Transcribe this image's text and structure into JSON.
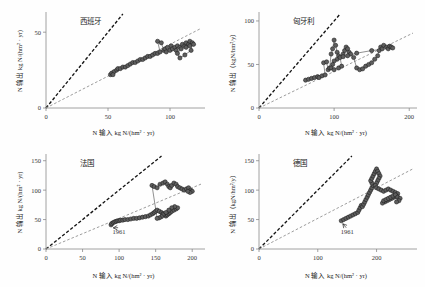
{
  "figure": {
    "background": "#fefefe",
    "panel_count": 4,
    "marker_fill": "#5e5e5e",
    "marker_stroke": "#1c1c1c",
    "ref_line_11_color": "#141414",
    "ref_line_lower_color": "#9d9d9d",
    "trajectory_color": "#555555"
  },
  "chart_data": [
    {
      "type": "scatter",
      "title": "西班牙",
      "xlabel": "N 输入 kg N/(hm² · yr)",
      "ylabel": "N 输出 kg N/(hm² · yr)",
      "xlim": [
        0,
        125
      ],
      "ylim": [
        0,
        62
      ],
      "xticks": [
        0,
        50,
        100
      ],
      "xtick_labels": [
        "0",
        "50",
        "100"
      ],
      "yticks": [
        0,
        50
      ],
      "ytick_labels": [
        "0",
        "50"
      ],
      "grid": false,
      "legend": "none",
      "reference_lines": [
        {
          "name": "1:1 line",
          "slope": 1.0,
          "style": "dashed",
          "color": "#141414"
        },
        {
          "name": "lower ratio line",
          "slope": 0.42,
          "style": "dashed",
          "color": "#9d9d9d"
        }
      ],
      "connected": true,
      "points": [
        [
          52,
          22
        ],
        [
          53,
          23
        ],
        [
          55,
          24
        ],
        [
          54,
          22
        ],
        [
          57,
          25
        ],
        [
          58,
          26
        ],
        [
          60,
          26
        ],
        [
          62,
          27
        ],
        [
          64,
          27
        ],
        [
          66,
          28
        ],
        [
          68,
          29
        ],
        [
          70,
          30
        ],
        [
          72,
          30
        ],
        [
          74,
          31
        ],
        [
          76,
          32
        ],
        [
          78,
          32
        ],
        [
          80,
          33
        ],
        [
          82,
          34
        ],
        [
          84,
          34
        ],
        [
          86,
          35
        ],
        [
          88,
          36
        ],
        [
          90,
          36
        ],
        [
          92,
          37
        ],
        [
          90,
          44
        ],
        [
          93,
          43
        ],
        [
          95,
          38
        ],
        [
          96,
          39
        ],
        [
          97,
          37
        ],
        [
          98,
          40
        ],
        [
          100,
          38
        ],
        [
          101,
          41
        ],
        [
          102,
          39
        ],
        [
          104,
          40
        ],
        [
          105,
          38
        ],
        [
          106,
          41
        ],
        [
          108,
          40
        ],
        [
          110,
          42
        ],
        [
          112,
          41
        ],
        [
          113,
          43
        ],
        [
          115,
          42
        ],
        [
          116,
          44
        ],
        [
          118,
          43
        ],
        [
          117,
          38
        ],
        [
          112,
          35
        ],
        [
          108,
          33
        ],
        [
          106,
          36
        ],
        [
          109,
          39
        ],
        [
          113,
          40
        ],
        [
          116,
          41
        ],
        [
          119,
          42
        ]
      ]
    },
    {
      "type": "scatter",
      "title": "匈牙利",
      "xlabel": "N 输入 kg N/(hm² · yr)",
      "ylabel": "N 输出（kgN/hm²/y）",
      "xlim": [
        0,
        205
      ],
      "ylim": [
        0,
        108
      ],
      "xticks": [
        0,
        100,
        200
      ],
      "xtick_labels": [
        "0",
        "100",
        "200"
      ],
      "yticks": [
        0,
        50,
        100
      ],
      "ytick_labels": [
        "0",
        "50",
        "100"
      ],
      "grid": false,
      "legend": "none",
      "reference_lines": [
        {
          "name": "1:1 line",
          "slope": 1.0,
          "style": "dashed",
          "color": "#141414"
        },
        {
          "name": "lower ratio line",
          "slope": 0.42,
          "style": "dashed",
          "color": "#9d9d9d"
        }
      ],
      "connected": true,
      "points": [
        [
          62,
          32
        ],
        [
          66,
          33
        ],
        [
          70,
          34
        ],
        [
          74,
          35
        ],
        [
          78,
          36
        ],
        [
          80,
          35
        ],
        [
          84,
          37
        ],
        [
          88,
          38
        ],
        [
          86,
          52
        ],
        [
          90,
          53
        ],
        [
          92,
          44
        ],
        [
          94,
          46
        ],
        [
          96,
          62
        ],
        [
          98,
          68
        ],
        [
          100,
          78
        ],
        [
          102,
          72
        ],
        [
          104,
          64
        ],
        [
          106,
          60
        ],
        [
          104,
          56
        ],
        [
          100,
          54
        ],
        [
          98,
          50
        ],
        [
          96,
          46
        ],
        [
          100,
          44
        ],
        [
          106,
          46
        ],
        [
          110,
          48
        ],
        [
          108,
          58
        ],
        [
          112,
          62
        ],
        [
          114,
          66
        ],
        [
          116,
          70
        ],
        [
          118,
          68
        ],
        [
          120,
          64
        ],
        [
          122,
          62
        ],
        [
          126,
          58
        ],
        [
          130,
          46
        ],
        [
          134,
          44
        ],
        [
          138,
          45
        ],
        [
          142,
          48
        ],
        [
          146,
          50
        ],
        [
          150,
          52
        ],
        [
          154,
          56
        ],
        [
          158,
          60
        ],
        [
          160,
          66
        ],
        [
          162,
          70
        ],
        [
          164,
          68
        ],
        [
          166,
          72
        ],
        [
          170,
          70
        ],
        [
          172,
          68
        ],
        [
          174,
          71
        ],
        [
          176,
          70
        ],
        [
          178,
          69
        ],
        [
          150,
          66
        ],
        [
          130,
          63
        ],
        [
          118,
          60
        ],
        [
          112,
          59
        ]
      ]
    },
    {
      "type": "scatter",
      "title": "法国",
      "xlabel": "N 输入 kg N/(hm² · yr)",
      "ylabel": "N 输出 kg N/(hm² · yr)",
      "xlim": [
        0,
        212
      ],
      "ylim": [
        0,
        158
      ],
      "xticks": [
        0,
        50,
        100,
        150,
        200
      ],
      "xtick_labels": [
        "0",
        "50",
        "100",
        "150",
        "200"
      ],
      "yticks": [
        0,
        50,
        100,
        150
      ],
      "ytick_labels": [
        "0",
        "50",
        "100",
        "150"
      ],
      "grid": false,
      "legend": "none",
      "annotations": [
        {
          "text": "1961",
          "x": 100,
          "y": 26,
          "arrow_to": [
            90,
            41
          ]
        }
      ],
      "reference_lines": [
        {
          "name": "1:1 line",
          "slope": 1.0,
          "style": "dashed",
          "color": "#141414"
        },
        {
          "name": "lower ratio line",
          "slope": 0.52,
          "style": "dashed",
          "color": "#9d9d9d"
        }
      ],
      "connected": true,
      "points": [
        [
          89,
          41
        ],
        [
          90,
          43
        ],
        [
          92,
          45
        ],
        [
          94,
          46
        ],
        [
          96,
          47
        ],
        [
          98,
          48
        ],
        [
          100,
          48
        ],
        [
          102,
          49
        ],
        [
          105,
          49
        ],
        [
          108,
          50
        ],
        [
          112,
          50
        ],
        [
          116,
          51
        ],
        [
          120,
          52
        ],
        [
          124,
          52
        ],
        [
          128,
          53
        ],
        [
          132,
          54
        ],
        [
          136,
          55
        ],
        [
          140,
          56
        ],
        [
          143,
          58
        ],
        [
          146,
          60
        ],
        [
          148,
          62
        ],
        [
          150,
          64
        ],
        [
          152,
          66
        ],
        [
          155,
          64
        ],
        [
          158,
          62
        ],
        [
          160,
          60
        ],
        [
          162,
          58
        ],
        [
          164,
          56
        ],
        [
          166,
          58
        ],
        [
          168,
          60
        ],
        [
          170,
          62
        ],
        [
          172,
          64
        ],
        [
          175,
          66
        ],
        [
          178,
          68
        ],
        [
          180,
          70
        ],
        [
          176,
          72
        ],
        [
          172,
          70
        ],
        [
          168,
          66
        ],
        [
          164,
          62
        ],
        [
          160,
          58
        ],
        [
          158,
          55
        ],
        [
          155,
          53
        ],
        [
          152,
          52
        ],
        [
          145,
          108
        ],
        [
          148,
          106
        ],
        [
          152,
          104
        ],
        [
          156,
          110
        ],
        [
          160,
          112
        ],
        [
          163,
          114
        ],
        [
          166,
          110
        ],
        [
          168,
          106
        ],
        [
          170,
          104
        ],
        [
          172,
          108
        ],
        [
          175,
          112
        ],
        [
          178,
          110
        ],
        [
          180,
          106
        ],
        [
          183,
          104
        ],
        [
          186,
          102
        ],
        [
          189,
          100
        ],
        [
          192,
          102
        ],
        [
          195,
          104
        ],
        [
          198,
          100
        ],
        [
          200,
          98
        ],
        [
          197,
          96
        ],
        [
          194,
          98
        ]
      ]
    },
    {
      "type": "scatter",
      "title": "德国",
      "xlabel": "N 输入 kg N/(hm² · yr)",
      "ylabel": "N 输出（kgN/hm²/y）",
      "xlim": [
        0,
        262
      ],
      "ylim": [
        0,
        158
      ],
      "xticks": [
        0,
        100,
        200
      ],
      "xtick_labels": [
        "0",
        "100",
        "200"
      ],
      "yticks": [
        0,
        50,
        100,
        150
      ],
      "ytick_labels": [
        "0",
        "50",
        "100",
        "150"
      ],
      "grid": false,
      "legend": "none",
      "annotations": [
        {
          "text": "1961",
          "x": 150,
          "y": 26,
          "arrow_to": [
            140,
            48
          ]
        }
      ],
      "reference_lines": [
        {
          "name": "1:1 line",
          "slope": 1.0,
          "style": "dashed",
          "color": "#141414"
        },
        {
          "name": "lower ratio line",
          "slope": 0.52,
          "style": "dashed",
          "color": "#9d9d9d"
        }
      ],
      "connected": true,
      "points": [
        [
          140,
          48
        ],
        [
          144,
          50
        ],
        [
          148,
          52
        ],
        [
          152,
          54
        ],
        [
          156,
          56
        ],
        [
          160,
          58
        ],
        [
          164,
          60
        ],
        [
          168,
          62
        ],
        [
          170,
          66
        ],
        [
          172,
          70
        ],
        [
          174,
          74
        ],
        [
          176,
          72
        ],
        [
          178,
          76
        ],
        [
          180,
          80
        ],
        [
          182,
          84
        ],
        [
          184,
          88
        ],
        [
          186,
          92
        ],
        [
          188,
          96
        ],
        [
          190,
          100
        ],
        [
          192,
          104
        ],
        [
          194,
          108
        ],
        [
          192,
          112
        ],
        [
          190,
          116
        ],
        [
          192,
          120
        ],
        [
          194,
          124
        ],
        [
          196,
          128
        ],
        [
          198,
          132
        ],
        [
          200,
          136
        ],
        [
          202,
          132
        ],
        [
          204,
          128
        ],
        [
          206,
          124
        ],
        [
          204,
          120
        ],
        [
          202,
          116
        ],
        [
          200,
          112
        ],
        [
          198,
          108
        ],
        [
          200,
          104
        ],
        [
          204,
          102
        ],
        [
          208,
          100
        ],
        [
          212,
          98
        ],
        [
          216,
          100
        ],
        [
          220,
          102
        ],
        [
          224,
          100
        ],
        [
          228,
          98
        ],
        [
          232,
          96
        ],
        [
          236,
          94
        ],
        [
          234,
          90
        ],
        [
          230,
          88
        ],
        [
          226,
          86
        ],
        [
          222,
          84
        ],
        [
          218,
          82
        ],
        [
          214,
          80
        ],
        [
          210,
          78
        ],
        [
          212,
          82
        ],
        [
          216,
          84
        ],
        [
          220,
          86
        ],
        [
          224,
          88
        ],
        [
          228,
          90
        ],
        [
          232,
          92
        ],
        [
          236,
          88
        ],
        [
          240,
          86
        ],
        [
          238,
          82
        ],
        [
          234,
          80
        ]
      ]
    }
  ]
}
